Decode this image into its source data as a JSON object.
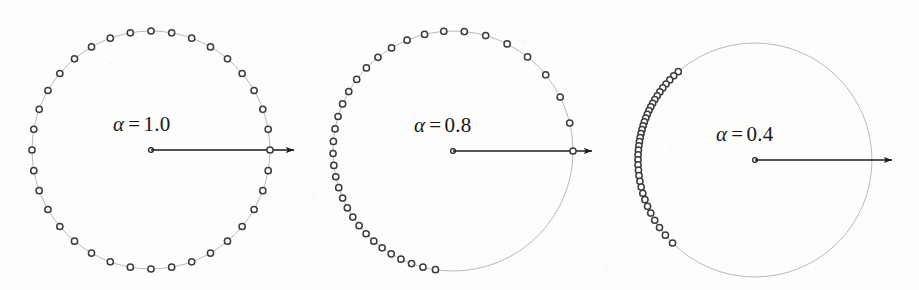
{
  "figure": {
    "background_color": "#fdfdfb",
    "width": 919,
    "height": 290,
    "circle_stroke": "#b9b9b9",
    "marker_stroke": "#3a3a3f",
    "marker_fill": "#ffffff",
    "arrow_color": "#1b1b1f",
    "panel_count": 3
  },
  "panels": [
    {
      "id": "panel-alpha-1",
      "label": "α = 1.0",
      "label_symbol": "α",
      "label_equals": "=",
      "label_value": "1.0",
      "alpha": 1.0,
      "cx": 151,
      "cy": 150,
      "r": 119,
      "label_x": 113,
      "label_y": 112,
      "arrow_x1": 151,
      "arrow_y1": 150,
      "arrow_x2": 303,
      "arrow_y2": 150,
      "n_points": 36,
      "circle_visible_arc_deg": 360
    },
    {
      "id": "panel-alpha-08",
      "label": "α = 0.8",
      "label_symbol": "α",
      "label_equals": "=",
      "label_value": "0.8",
      "alpha": 0.8,
      "cx": 453,
      "cy": 151,
      "r": 120,
      "label_x": 414,
      "label_y": 113,
      "arrow_x1": 453,
      "arrow_y1": 151,
      "arrow_x2": 601,
      "arrow_y2": 151,
      "n_points": 36,
      "circle_visible_arc_deg": 360
    },
    {
      "id": "panel-alpha-04",
      "label": "α = 0.4",
      "label_symbol": "α",
      "label_equals": "=",
      "label_value": "0.4",
      "alpha": 0.4,
      "cx": 755,
      "cy": 160,
      "r": 117,
      "label_x": 716,
      "label_y": 122,
      "arrow_x1": 755,
      "arrow_y1": 160,
      "arrow_x2": 901,
      "arrow_y2": 160,
      "n_points": 36,
      "circle_visible_arc_deg": 360
    }
  ],
  "chart_data": {
    "type": "scatter",
    "title": "",
    "xlabel": "",
    "ylabel": "",
    "grid": false,
    "legend": null,
    "annotations": [
      "α = 1.0",
      "α = 0.8",
      "α = 0.4"
    ],
    "series": [
      {
        "name": "α = 1.0",
        "alpha": 1.0,
        "n": 36,
        "angles_deg": [
          0,
          10,
          20,
          30,
          40,
          50,
          60,
          70,
          80,
          90,
          100,
          110,
          120,
          130,
          140,
          150,
          160,
          170,
          180,
          190,
          200,
          210,
          220,
          230,
          240,
          250,
          260,
          270,
          280,
          290,
          300,
          310,
          320,
          330,
          340,
          350
        ]
      },
      {
        "name": "α = 0.8",
        "alpha": 0.8,
        "n": 36,
        "angles_deg": [
          0,
          13.5,
          26.7,
          39.4,
          51.6,
          63.2,
          74.2,
          84.6,
          94.4,
          103.7,
          112.5,
          120.8,
          128.7,
          136.2,
          143.4,
          150.3,
          156.9,
          163.3,
          169.4,
          175.4,
          181.2,
          186.9,
          192.4,
          197.8,
          203.1,
          208.3,
          213.4,
          218.5,
          223.6,
          228.7,
          233.8,
          239.0,
          244.3,
          249.8,
          255.5,
          261.6
        ]
      },
      {
        "name": "α = 0.4",
        "alpha": 0.4,
        "n": 36,
        "angles_deg": [
          131.0,
          134.0,
          136.8,
          139.5,
          142.0,
          144.4,
          146.7,
          148.9,
          151.0,
          153.0,
          155.0,
          157.0,
          159.0,
          161.0,
          163.0,
          165.0,
          167.0,
          169.0,
          171.0,
          173.0,
          175.2,
          177.5,
          179.9,
          182.4,
          185.0,
          187.7,
          190.5,
          193.4,
          196.5,
          199.8,
          203.3,
          207.0,
          211.0,
          215.3,
          220.0,
          225.2
        ]
      }
    ]
  }
}
